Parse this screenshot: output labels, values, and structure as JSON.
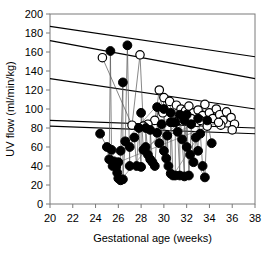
{
  "chart_data": {
    "type": "scatter",
    "title": "",
    "xlabel": "Gestational age (weeks)",
    "ylabel": "UV flow (ml/min/kg)",
    "xlim": [
      20,
      38
    ],
    "ylim": [
      0,
      200
    ],
    "xticks": [
      20,
      22,
      24,
      26,
      28,
      30,
      32,
      34,
      36,
      38
    ],
    "yticks": [
      0,
      20,
      40,
      60,
      80,
      100,
      120,
      140,
      160,
      180,
      200
    ],
    "xtick_labels": [
      "20",
      "22",
      "24",
      "26",
      "28",
      "30",
      "32",
      "34",
      "36",
      "38"
    ],
    "ytick_labels": [
      "0",
      "20",
      "40",
      "60",
      "80",
      "100",
      "120",
      "140",
      "160",
      "180",
      "200"
    ],
    "grid": false,
    "legend": null,
    "series": [
      {
        "name": "open-circles",
        "marker": "open-circle",
        "color": "#ffffff",
        "edge_color": "#000000",
        "points": [
          [
            24.6,
            154
          ],
          [
            27.9,
            157
          ],
          [
            29.6,
            120
          ],
          [
            30.0,
            112
          ],
          [
            30.5,
            108
          ],
          [
            31.1,
            104
          ],
          [
            31.5,
            100
          ],
          [
            31.9,
            98
          ],
          [
            32.2,
            103
          ],
          [
            32.6,
            96
          ],
          [
            33.0,
            99
          ],
          [
            33.4,
            93
          ],
          [
            33.6,
            105
          ],
          [
            34.0,
            96
          ],
          [
            34.3,
            90
          ],
          [
            34.6,
            100
          ],
          [
            34.9,
            94
          ],
          [
            35.2,
            88
          ],
          [
            35.5,
            97
          ],
          [
            35.9,
            91
          ],
          [
            36.2,
            84
          ],
          [
            30.8,
            86
          ],
          [
            29.2,
            88
          ],
          [
            28.6,
            84
          ],
          [
            31.3,
            88
          ],
          [
            32.9,
            86
          ],
          [
            33.8,
            82
          ],
          [
            35.0,
            83
          ],
          [
            36.0,
            78
          ],
          [
            29.9,
            96
          ],
          [
            31.7,
            92
          ],
          [
            32.4,
            90
          ],
          [
            33.2,
            88
          ],
          [
            34.8,
            86
          ],
          [
            28.2,
            82
          ],
          [
            27.2,
            83
          ]
        ]
      },
      {
        "name": "filled-circles",
        "marker": "filled-circle",
        "color": "#000000",
        "edge_color": "#000000",
        "points": [
          [
            25.3,
            161
          ],
          [
            26.8,
            167
          ],
          [
            26.4,
            128
          ],
          [
            24.4,
            74
          ],
          [
            25.0,
            60
          ],
          [
            25.4,
            57
          ],
          [
            25.2,
            47
          ],
          [
            25.6,
            45
          ],
          [
            25.5,
            40
          ],
          [
            25.8,
            39
          ],
          [
            25.9,
            33
          ],
          [
            26.0,
            27
          ],
          [
            26.2,
            25
          ],
          [
            26.4,
            26
          ],
          [
            27.0,
            40
          ],
          [
            27.6,
            40
          ],
          [
            28.0,
            39
          ],
          [
            28.4,
            60
          ],
          [
            28.2,
            57
          ],
          [
            28.6,
            52
          ],
          [
            28.8,
            47
          ],
          [
            29.0,
            44
          ],
          [
            29.2,
            40
          ],
          [
            27.8,
            80
          ],
          [
            28.4,
            80
          ],
          [
            29.6,
            64
          ],
          [
            30.0,
            56
          ],
          [
            30.2,
            48
          ],
          [
            30.4,
            40
          ],
          [
            30.6,
            32
          ],
          [
            30.8,
            30
          ],
          [
            31.0,
            30
          ],
          [
            31.4,
            30
          ],
          [
            31.8,
            29
          ],
          [
            32.2,
            30
          ],
          [
            29.4,
            75
          ],
          [
            30.3,
            72
          ],
          [
            31.2,
            76
          ],
          [
            31.6,
            68
          ],
          [
            32.0,
            60
          ],
          [
            32.3,
            52
          ],
          [
            32.6,
            44
          ],
          [
            33.6,
            28
          ],
          [
            33.0,
            56
          ],
          [
            29.8,
            84
          ],
          [
            30.6,
            86
          ],
          [
            31.0,
            86
          ],
          [
            31.8,
            88
          ],
          [
            32.4,
            84
          ],
          [
            28.8,
            78
          ],
          [
            27.4,
            70
          ],
          [
            26.6,
            66
          ],
          [
            32.8,
            70
          ],
          [
            33.2,
            74
          ],
          [
            30.0,
            100
          ],
          [
            30.6,
            96
          ],
          [
            31.4,
            94
          ],
          [
            32.0,
            94
          ],
          [
            29.4,
            102
          ],
          [
            28.0,
            96
          ],
          [
            33.0,
            90
          ],
          [
            33.8,
            88
          ],
          [
            34.2,
            64
          ],
          [
            27.0,
            60
          ],
          [
            26.2,
            56
          ],
          [
            33.4,
            40
          ],
          [
            26.0,
            44
          ]
        ]
      }
    ],
    "reference_lines": [
      {
        "name": "line-1",
        "x1": 20,
        "y1": 187,
        "x2": 38,
        "y2": 155
      },
      {
        "name": "line-2",
        "x1": 20,
        "y1": 172,
        "x2": 38,
        "y2": 132
      },
      {
        "name": "line-3",
        "x1": 20,
        "y1": 132,
        "x2": 38,
        "y2": 100
      },
      {
        "name": "line-4",
        "x1": 20,
        "y1": 88,
        "x2": 38,
        "y2": 80
      },
      {
        "name": "line-5",
        "x1": 20,
        "y1": 82,
        "x2": 38,
        "y2": 74
      }
    ]
  }
}
